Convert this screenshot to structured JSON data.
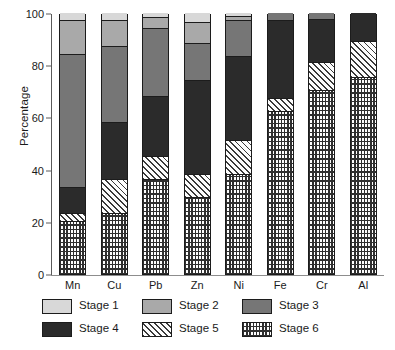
{
  "chart_data": {
    "type": "bar",
    "subtype": "stacked-bar-100-percent",
    "title": "",
    "xlabel": "",
    "ylabel": "Percentage",
    "ylim": [
      0,
      100
    ],
    "yticks": [
      0,
      20,
      40,
      60,
      80,
      100
    ],
    "ytick_labels": [
      "0",
      "20",
      "40",
      "60",
      "80",
      "100"
    ],
    "grid": false,
    "legend_position": "below-axis",
    "categories": [
      "Mn",
      "Cu",
      "Pb",
      "Zn",
      "Ni",
      "Fe",
      "Cr",
      "Al"
    ],
    "series": [
      {
        "name": "Stage 1",
        "fill": "solid-lightest-gray",
        "color": "#d8d8d8",
        "values": [
          3,
          3,
          2,
          4,
          1.5,
          0,
          0,
          0
        ]
      },
      {
        "name": "Stage 2",
        "fill": "solid-light-gray",
        "color": "#a9a9a9",
        "values": [
          13,
          10,
          4,
          8,
          1.5,
          0,
          0,
          0
        ]
      },
      {
        "name": "Stage 3",
        "fill": "solid-mid-gray",
        "color": "#767676",
        "values": [
          51,
          29,
          26,
          14,
          14,
          3,
          2.5,
          0
        ]
      },
      {
        "name": "Stage 4",
        "fill": "solid-dark",
        "color": "#2b2b2b",
        "values": [
          10,
          22,
          23,
          36,
          32,
          30,
          16.5,
          11
        ]
      },
      {
        "name": "Stage 5",
        "fill": "diagonal-hatch",
        "color": "#fdfdfd",
        "values": [
          3,
          13,
          9,
          9,
          13,
          5,
          11,
          14
        ]
      },
      {
        "name": "Stage 6",
        "fill": "dotted-grid",
        "color": "#fdfdfd",
        "values": [
          20,
          23,
          36,
          29,
          38,
          62,
          70,
          75
        ]
      }
    ],
    "stack_order_bottom_to_top": [
      "Stage 6",
      "Stage 5",
      "Stage 4",
      "Stage 3",
      "Stage 2",
      "Stage 1"
    ],
    "legend": [
      {
        "label": "Stage 1",
        "swatch": "fill-s1"
      },
      {
        "label": "Stage 2",
        "swatch": "fill-s2"
      },
      {
        "label": "Stage 3",
        "swatch": "fill-s3"
      },
      {
        "label": "Stage 4",
        "swatch": "fill-s4"
      },
      {
        "label": "Stage 5",
        "swatch": "fill-s5"
      },
      {
        "label": "Stage 6",
        "swatch": "fill-s6"
      }
    ]
  }
}
